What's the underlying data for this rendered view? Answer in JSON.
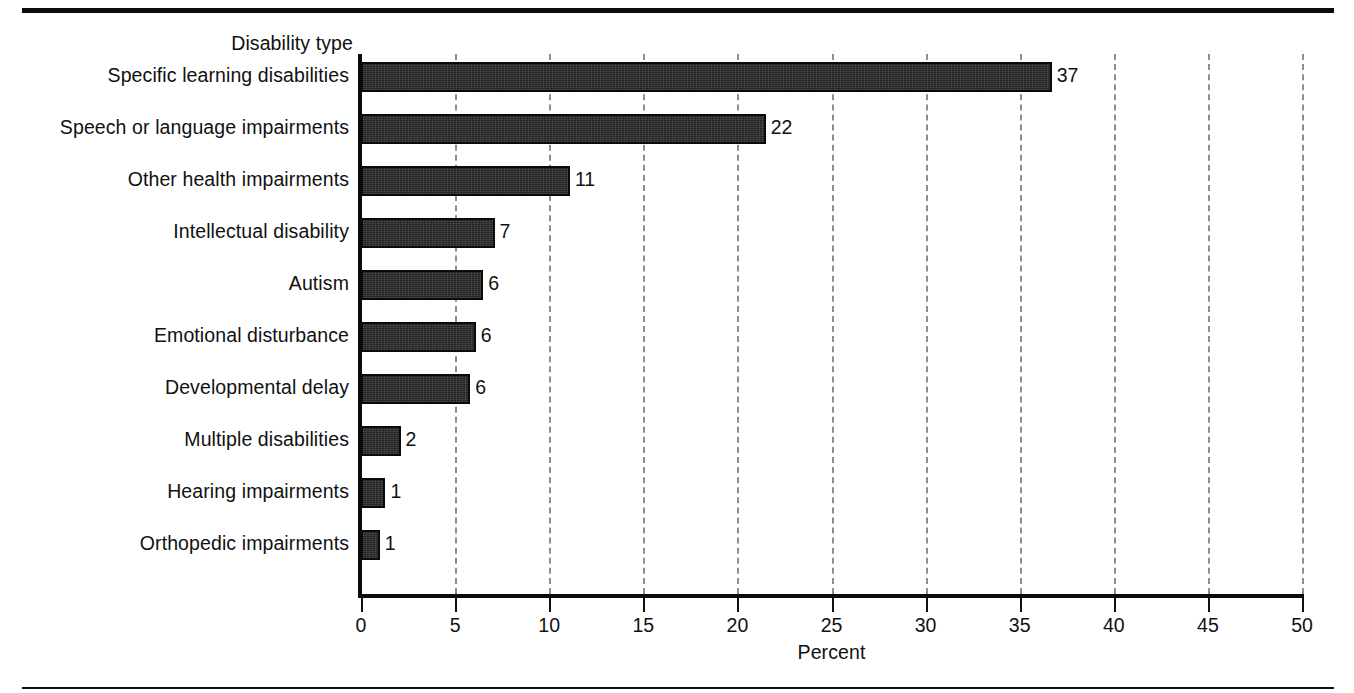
{
  "chart_data": {
    "type": "bar",
    "orientation": "horizontal",
    "title": "",
    "xlabel": "Percent",
    "ylabel": "Disability type",
    "xlim": [
      0,
      50
    ],
    "xticks": [
      0,
      5,
      10,
      15,
      20,
      25,
      30,
      35,
      40,
      45,
      50
    ],
    "xticklabels": [
      "0",
      "5",
      "10",
      "15",
      "20",
      "25",
      "30",
      "35",
      "40",
      "45",
      "50"
    ],
    "grid": "vertical-dashed",
    "legend": "none",
    "bar_color": "#232323",
    "categories": [
      "Specific learning disabilities",
      "Speech or language impairments",
      "Other health impairments",
      "Intellectual disability",
      "Autism",
      "Emotional disturbance",
      "Developmental delay",
      "Multiple disabilities",
      "Hearing impairments",
      "Orthopedic impairments"
    ],
    "values": [
      36.7,
      21.5,
      11.1,
      7.1,
      6.5,
      6.1,
      5.8,
      2.1,
      1.3,
      1.0
    ],
    "data_labels": [
      "37",
      "22",
      "11",
      "7",
      "6",
      "6",
      "6",
      "2",
      "1",
      "1"
    ]
  }
}
